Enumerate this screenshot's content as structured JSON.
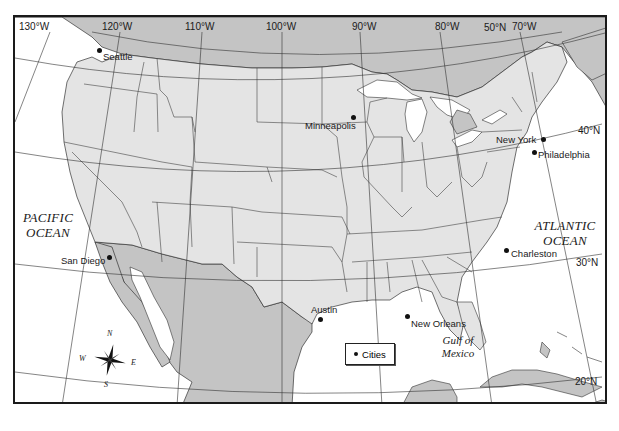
{
  "map": {
    "title_fragment_visible": false,
    "longitude_labels": [
      {
        "label": "130°W",
        "x": 17
      },
      {
        "label": "120°W",
        "x": 100
      },
      {
        "label": "110°W",
        "x": 183
      },
      {
        "label": "100°W",
        "x": 264
      },
      {
        "label": "90°W",
        "x": 346
      },
      {
        "label": "80°W",
        "x": 428
      },
      {
        "label": "70°W",
        "x": 506
      }
    ],
    "latitude_labels": [
      {
        "label": "50°N",
        "x": 478,
        "y": 8
      },
      {
        "label": "40°N",
        "x": 580,
        "y": 112
      },
      {
        "label": "30°N",
        "x": 576,
        "y": 244
      },
      {
        "label": "20°N",
        "x": 574,
        "y": 362
      }
    ],
    "oceans": [
      {
        "name": "pacific",
        "line1": "PACIFIC",
        "line2": "OCEAN"
      },
      {
        "name": "atlantic",
        "line1": "ATLANTIC",
        "line2": "OCEAN"
      },
      {
        "name": "gulf",
        "line1": "Gulf of",
        "line2": "Mexico"
      }
    ],
    "cities": [
      {
        "name": "Seattle",
        "dot_x": 85,
        "dot_y": 46,
        "label_x": 90,
        "label_y": 48
      },
      {
        "name": "Minneapolis",
        "dot_x": 337,
        "dot_y": 100,
        "label_x": 290,
        "label_y": 103
      },
      {
        "name": "New York",
        "dot_x": 527,
        "dot_y": 122,
        "label_x": 469,
        "label_y": 118
      },
      {
        "name": "Philadelphia",
        "dot_x": 518,
        "dot_y": 135,
        "label_x": 522,
        "label_y": 133
      },
      {
        "name": "San Diego",
        "dot_x": 93,
        "dot_y": 240,
        "label_x": 47,
        "label_y": 238
      },
      {
        "name": "Charleston",
        "dot_x": 490,
        "dot_y": 233,
        "label_x": 495,
        "label_y": 231
      },
      {
        "name": "Austin",
        "dot_x": 301,
        "dot_y": 301,
        "label_x": 293,
        "label_y": 290
      },
      {
        "name": "New Orleans",
        "dot_x": 390,
        "dot_y": 297,
        "label_x": 394,
        "label_y": 299
      }
    ],
    "legend": {
      "label": "Cities"
    },
    "compass": {
      "n": "N",
      "s": "S",
      "e": "E",
      "w": "W"
    },
    "colors": {
      "us_land": "#e4e4e4",
      "foreign_land": "#c4c4c4",
      "water": "#ffffff",
      "border": "#333333",
      "frame": "#1a1a1a"
    }
  }
}
